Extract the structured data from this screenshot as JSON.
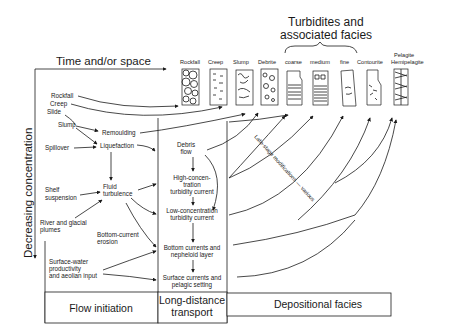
{
  "title": {
    "time_axis": "Time and/or space",
    "concentration_axis": "Decreasing concentration",
    "turbidites_line1": "Turbidites and",
    "turbidites_line2": "associated facies"
  },
  "facies": [
    {
      "label": "Rockfall"
    },
    {
      "label": "Creep"
    },
    {
      "label": "Slump"
    },
    {
      "label": "Debrite"
    },
    {
      "label": "coarse"
    },
    {
      "label": "medium"
    },
    {
      "label": "fine"
    },
    {
      "label": "Contourite"
    },
    {
      "label": "Pelagite",
      "label2": "Hemipelagite"
    }
  ],
  "flow_initiation": {
    "sources": {
      "rockfall": "Rockfall",
      "creep": "Creep",
      "slide": "Slide",
      "slump": "Slump",
      "spillover": "Spillover",
      "shelf1": "Shelf",
      "shelf2": "suspension",
      "river1": "River and glacial",
      "river2": "plumes",
      "surface1": "Surface-water",
      "surface2": "productivity",
      "surface3": "and aeolian input"
    },
    "processes": {
      "remoulding": "Remoulding",
      "liquefaction": "Liquefaction",
      "fluid1": "Fluid",
      "fluid2": "turbulence",
      "bottom1": "Bottom-current",
      "bottom2": "erosion"
    }
  },
  "transport": {
    "debris1": "Debris",
    "debris2": "flow",
    "high1": "High-concen-",
    "high2": "tration",
    "high3": "turbidity current",
    "low1": "Low-concentration",
    "low2": "turbidity current",
    "bcur1": "Bottom currents and",
    "bcur2": "nepheloid layer",
    "surf1": "Surface currents and",
    "surf2": "pelagic setting"
  },
  "annotation": "Late-stage modifications — various",
  "footer": {
    "flow_initiation": "Flow initiation",
    "long_distance1": "Long-distance",
    "long_distance2": "transport",
    "depositional": "Depositional facies"
  }
}
